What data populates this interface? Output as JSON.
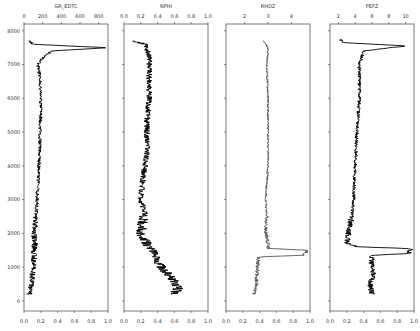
{
  "chart_data": [
    {
      "type": "line",
      "title": "GR_EDTC",
      "xlabel": "GR_EDTC",
      "ylabel": "Depth",
      "top_axis": {
        "ticks": [
          0,
          200,
          400,
          600,
          800
        ],
        "range": [
          0,
          900
        ]
      },
      "bottom_axis": {
        "ticks": [
          "0.0",
          "0.2",
          "0.4",
          "0.6",
          "0.8",
          "1.0"
        ]
      },
      "ylim": [
        -300,
        8200
      ],
      "y_ticks": [
        0,
        1000,
        2000,
        3000,
        4000,
        5000,
        6000,
        7000,
        8000
      ],
      "color": "#000000",
      "depth": [
        200,
        500,
        1000,
        1500,
        1800,
        2000,
        2500,
        3000,
        3500,
        4000,
        4500,
        5000,
        5500,
        6000,
        6500,
        7000,
        7200,
        7400,
        7500,
        7550,
        7600,
        7700
      ],
      "values": [
        60,
        80,
        100,
        110,
        120,
        100,
        130,
        140,
        150,
        160,
        170,
        170,
        180,
        180,
        175,
        150,
        200,
        300,
        900,
        450,
        100,
        60
      ]
    },
    {
      "type": "line",
      "title": "NPHI",
      "xlabel": "NPHI",
      "top_axis": {
        "ticks": [
          "0.0",
          "0.2",
          "0.4",
          "0.6",
          "0.8",
          "1.0"
        ],
        "range": [
          0,
          1
        ]
      },
      "bottom_axis": {
        "ticks": [
          "0.0",
          "0.2",
          "0.4",
          "0.6",
          "0.8",
          "1.0"
        ]
      },
      "ylim": [
        -300,
        8200
      ],
      "color": "#000000",
      "depth": [
        200,
        400,
        700,
        1000,
        1300,
        1600,
        1800,
        2000,
        2300,
        2600,
        3000,
        3500,
        4000,
        4500,
        5000,
        5500,
        6000,
        6500,
        7000,
        7300,
        7600,
        7700
      ],
      "values": [
        0.6,
        0.65,
        0.55,
        0.45,
        0.38,
        0.3,
        0.25,
        0.2,
        0.22,
        0.25,
        0.2,
        0.22,
        0.25,
        0.28,
        0.27,
        0.28,
        0.3,
        0.3,
        0.3,
        0.3,
        0.25,
        0.1
      ]
    },
    {
      "type": "line",
      "title": "RHOZ",
      "xlabel": "RHOZ",
      "top_axis": {
        "ticks": [
          2,
          3,
          4
        ],
        "range": [
          1.2,
          4.8
        ]
      },
      "bottom_axis": {
        "ticks": [
          "0.0",
          "0.2",
          "0.4",
          "0.6",
          "0.8",
          "1.0"
        ]
      },
      "ylim": [
        -300,
        8200
      ],
      "color": "#555555",
      "depth": [
        200,
        500,
        1000,
        1300,
        1350,
        1500,
        1550,
        1700,
        2000,
        2500,
        3000,
        3500,
        4000,
        5000,
        6000,
        7000,
        7500,
        7700
      ],
      "values": [
        2.4,
        2.5,
        2.55,
        2.6,
        4.5,
        4.7,
        3.0,
        3.0,
        2.9,
        2.95,
        2.9,
        2.95,
        3.0,
        3.0,
        3.0,
        2.95,
        3.0,
        2.8
      ]
    },
    {
      "type": "line",
      "title": "PEFZ",
      "xlabel": "PEFZ",
      "top_axis": {
        "ticks": [
          2,
          4,
          6,
          8,
          10
        ],
        "range": [
          1,
          11
        ]
      },
      "bottom_axis": {
        "ticks": [
          "0.0",
          "0.2",
          "0.4",
          "0.6",
          "0.8",
          "1.0"
        ]
      },
      "ylim": [
        -300,
        8200
      ],
      "color": "#000000",
      "depth": [
        200,
        500,
        800,
        1100,
        1350,
        1400,
        1550,
        1600,
        1700,
        2000,
        2500,
        3000,
        4000,
        5000,
        6000,
        7000,
        7400,
        7550,
        7650,
        7750
      ],
      "values": [
        6.0,
        5.8,
        6.2,
        5.9,
        6.0,
        10.5,
        10.5,
        4.5,
        3.0,
        3.2,
        3.6,
        3.8,
        4.0,
        4.2,
        4.5,
        4.5,
        5.0,
        10.0,
        2.5,
        2.2
      ]
    }
  ],
  "figure": {
    "y_tick_labels": [
      "0",
      "1000",
      "2000",
      "3000",
      "4000",
      "5000",
      "6000",
      "7000",
      "8000"
    ],
    "bottom_tick_labels": [
      "0.0",
      "0.2",
      "0.4",
      "0.6",
      "0.8",
      "1.0"
    ],
    "track_titles": [
      "GR_EDTC",
      "NPHI",
      "RHOZ",
      "PEFZ"
    ],
    "track_top_ticks": [
      [
        "0",
        "200",
        "400",
        "600",
        "800"
      ],
      [
        "0.0",
        "0.2",
        "0.4",
        "0.6",
        "0.8",
        "1.0"
      ],
      [
        "2",
        "3",
        "4"
      ],
      [
        "2",
        "4",
        "6",
        "8",
        "10"
      ]
    ]
  }
}
